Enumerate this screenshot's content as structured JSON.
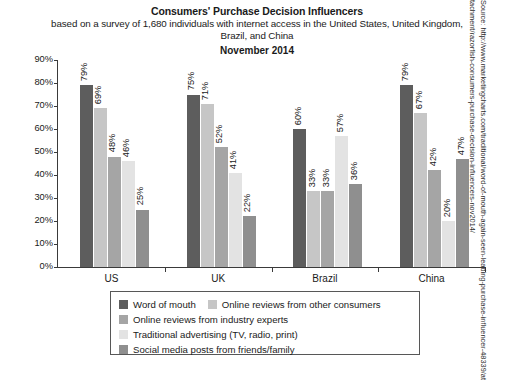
{
  "chart_data": {
    "type": "bar",
    "title": "Consumers' Purchase Decision Influencers",
    "subtitle": "based on a survey of 1,680 individuals with internet access in the United States, United Kingdom, Brazil, and China",
    "date": "November 2014",
    "xlabel": "",
    "ylabel": "",
    "ylim": [
      0,
      90
    ],
    "ytick_labels": [
      "90%",
      "80%",
      "70%",
      "60%",
      "50%",
      "40%",
      "30%",
      "20%",
      "10%",
      "0%"
    ],
    "ytick_values": [
      90,
      80,
      70,
      60,
      50,
      40,
      30,
      20,
      10,
      0
    ],
    "grid": false,
    "legend_position": "bottom",
    "categories": [
      "US",
      "UK",
      "Brazil",
      "China"
    ],
    "series": [
      {
        "name": "Word of mouth",
        "color": "#5d5d5d",
        "values": [
          79,
          75,
          60,
          79
        ],
        "labels": [
          "79%",
          "75%",
          "60%",
          "79%"
        ]
      },
      {
        "name": "Online reviews from other consumers",
        "color": "#c6c6c6",
        "values": [
          69,
          71,
          33,
          67
        ],
        "labels": [
          "69%",
          "71%",
          "33%",
          "67%"
        ]
      },
      {
        "name": "Online reviews from industry experts",
        "color": "#a5a5a5",
        "values": [
          48,
          52,
          33,
          42
        ],
        "labels": [
          "48%",
          "52%",
          "33%",
          "42%"
        ]
      },
      {
        "name": "Traditional advertising (TV, radio, print)",
        "color": "#e3e3e3",
        "values": [
          46,
          41,
          57,
          20
        ],
        "labels": [
          "46%",
          "41%",
          "57%",
          "20%"
        ]
      },
      {
        "name": "Social media posts from friends/family",
        "color": "#8f8f8f",
        "values": [
          25,
          22,
          36,
          47
        ],
        "labels": [
          "25%",
          "22%",
          "36%",
          "47%"
        ]
      }
    ]
  },
  "source": {
    "prefix": "Source: ",
    "url": "http://www.marketingcharts.com/traditional/word-of-mouth-again-seen-leading-purchase-influencer-48339/attachment/razorfish-consumers-purchase-decision-influencers-nov2014/",
    "full": "Source: http://www.marketingcharts.com/traditional/word-of-mouth-again-seen-leading-purchase-influencer-48339/attachment/razorfish-consumers-purchase-decision-influencers-nov2014/"
  }
}
